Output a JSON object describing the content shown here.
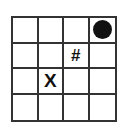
{
  "board": {
    "rows": 4,
    "cols": 4,
    "cells": [
      [
        "",
        "",
        "",
        "circle"
      ],
      [
        "",
        "",
        "#",
        ""
      ],
      [
        "",
        "X",
        "",
        ""
      ],
      [
        "",
        "",
        "",
        ""
      ]
    ]
  },
  "marks": {
    "circle": {
      "row": 0,
      "col": 3,
      "color": "#111111"
    },
    "hash": {
      "row": 1,
      "col": 2,
      "label": "#"
    },
    "x": {
      "row": 2,
      "col": 1,
      "label": "X"
    }
  }
}
